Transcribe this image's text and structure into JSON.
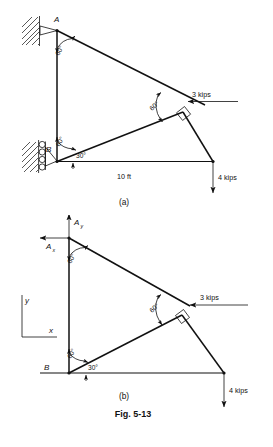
{
  "figure": {
    "number": "Fig. 5-13",
    "panels": [
      {
        "id": "a",
        "caption": "(a)",
        "type": "space-diagram"
      },
      {
        "id": "b",
        "caption": "(b)",
        "type": "free-body-diagram"
      }
    ]
  },
  "panel_a": {
    "caption": "(a)",
    "joint_a_label": "A",
    "joint_b_label": "B",
    "angle_at_a": "60°",
    "angle_at_b_upper": "60°",
    "angle_at_b_lower": "30°",
    "angle_at_joint": "60°",
    "dimension": "10 ft",
    "load_horizontal": "3 kips",
    "load_vertical": "4 kips",
    "support_a": "pin-support-icon",
    "support_b": "roller-support-icon",
    "right_angle_marker": "right-angle-icon"
  },
  "panel_b": {
    "caption": "(b)",
    "joint_b_label": "B",
    "reaction_vertical": "A",
    "reaction_vertical_sub": "y",
    "reaction_horizontal": "A",
    "reaction_horizontal_sub": "x",
    "axis_y_label": "y",
    "axis_x_label": "x",
    "angle_at_a": "60°",
    "angle_at_b_upper": "60°",
    "angle_at_b_lower": "30°",
    "angle_at_joint": "60°",
    "load_horizontal": "3 kips",
    "load_vertical": "4 kips",
    "right_angle_marker": "right-angle-icon"
  },
  "colors": {
    "ink": "#111111",
    "paper": "#ffffff"
  }
}
